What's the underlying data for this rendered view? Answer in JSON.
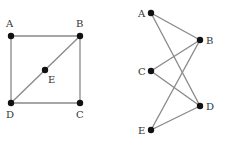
{
  "graphs": [
    {
      "nodes": [
        {
          "id": "A",
          "x": 11,
          "y": 36,
          "lx": 6,
          "ly": 27
        },
        {
          "id": "B",
          "x": 80,
          "y": 36,
          "lx": 76,
          "ly": 27
        },
        {
          "id": "E",
          "x": 45,
          "y": 70,
          "lx": 48,
          "ly": 83
        },
        {
          "id": "D",
          "x": 11,
          "y": 103,
          "lx": 6,
          "ly": 118
        },
        {
          "id": "C",
          "x": 80,
          "y": 103,
          "lx": 76,
          "ly": 118
        }
      ],
      "edges": [
        [
          "A",
          "B"
        ],
        [
          "A",
          "D"
        ],
        [
          "B",
          "C"
        ],
        [
          "D",
          "C"
        ],
        [
          "B",
          "E"
        ],
        [
          "E",
          "D"
        ]
      ]
    },
    {
      "nodes": [
        {
          "id": "A",
          "x": 151,
          "y": 13,
          "lx": 138,
          "ly": 17
        },
        {
          "id": "B",
          "x": 200,
          "y": 40,
          "lx": 206,
          "ly": 44
        },
        {
          "id": "C",
          "x": 151,
          "y": 71,
          "lx": 138,
          "ly": 75
        },
        {
          "id": "D",
          "x": 200,
          "y": 106,
          "lx": 206,
          "ly": 110
        },
        {
          "id": "E",
          "x": 151,
          "y": 130,
          "lx": 138,
          "ly": 134
        }
      ],
      "edges": [
        [
          "A",
          "B"
        ],
        [
          "A",
          "D"
        ],
        [
          "C",
          "B"
        ],
        [
          "C",
          "D"
        ],
        [
          "E",
          "B"
        ],
        [
          "E",
          "D"
        ]
      ]
    }
  ],
  "colors": {
    "node": "#111111",
    "edge": "#888888",
    "label": "#333333"
  }
}
